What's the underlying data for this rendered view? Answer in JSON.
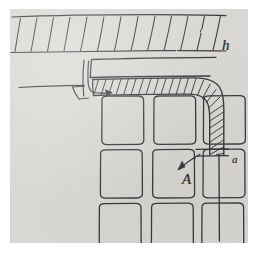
{
  "figure": {
    "kind": "hand-drawn-engineering-sketch",
    "medium": "pencil on gray paper",
    "paper_color": "#d8d7d3",
    "ink_color": "#3a3a3d",
    "page_background": "#ffffff"
  },
  "labels": [
    {
      "id": "h",
      "text": "h",
      "role": "dimension-label-top-band"
    },
    {
      "id": "a",
      "text": "a",
      "role": "dimension-label-right-wall"
    },
    {
      "id": "A",
      "text": "A",
      "role": "detail-callout-cell"
    }
  ],
  "annotations": {
    "top_band": {
      "name": "hatched-top-band",
      "hatch_stroke_count": 13,
      "label": "h"
    },
    "corner_wall": {
      "name": "hatched-corner-wall",
      "hatch_stroke_count": 18,
      "label": "a",
      "has_rounded_corner": true
    },
    "cell_grid": {
      "name": "rounded-cell-grid",
      "rows": 3,
      "columns": 3,
      "bottom_row_clipped": true
    },
    "left_hook": {
      "name": "left-hook-detail",
      "has_leader_arrow": true
    },
    "callout_arrow": {
      "name": "callout-arrow-A",
      "points_to": "right-wall-inner-face"
    }
  }
}
